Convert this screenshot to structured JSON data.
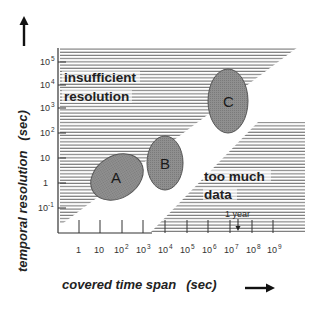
{
  "diagram": {
    "y_axis": {
      "title": "temporal resolution",
      "unit": "(sec)",
      "ticks": [
        {
          "base": "10",
          "exp": "5"
        },
        {
          "base": "10",
          "exp": "4"
        },
        {
          "base": "10",
          "exp": "3"
        },
        {
          "base": "10",
          "exp": "2"
        },
        {
          "base": "10",
          "exp": ""
        },
        {
          "base": "1",
          "exp": ""
        },
        {
          "base": "10",
          "exp": "-1"
        }
      ]
    },
    "x_axis": {
      "title": "covered time span",
      "unit": "(sec)",
      "ticks": [
        {
          "base": "1",
          "exp": ""
        },
        {
          "base": "10",
          "exp": ""
        },
        {
          "base": "10",
          "exp": "2"
        },
        {
          "base": "10",
          "exp": "3"
        },
        {
          "base": "10",
          "exp": "4"
        },
        {
          "base": "10",
          "exp": "5"
        },
        {
          "base": "10",
          "exp": "6"
        },
        {
          "base": "10",
          "exp": "7"
        },
        {
          "base": "10",
          "exp": "8"
        },
        {
          "base": "10",
          "exp": "9"
        }
      ]
    },
    "regions": {
      "upper_left": {
        "line1": "insufficient",
        "line2": "resolution"
      },
      "lower_right": {
        "line1": "too much",
        "line2": "data"
      }
    },
    "annotation": {
      "text": "1 year"
    },
    "ellipses": [
      {
        "label": "A"
      },
      {
        "label": "B"
      },
      {
        "label": "C"
      }
    ],
    "colors": {
      "ellipse_fill": "#8c8c8c",
      "hatch": "#555555",
      "axis": "#333333"
    }
  }
}
